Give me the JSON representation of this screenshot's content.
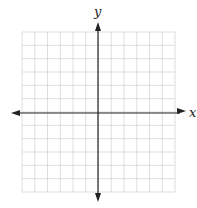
{
  "diagram": {
    "type": "coordinate-plane",
    "x_axis_label": "x",
    "y_axis_label": "y",
    "grid": {
      "columns": 12,
      "rows": 12
    },
    "colors": {
      "grid": "#d4d4d4",
      "axis": "#222222",
      "background": "#ffffff"
    }
  }
}
